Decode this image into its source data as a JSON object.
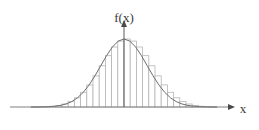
{
  "figure": {
    "title": "",
    "background_color": "#ffffff",
    "curve_color": "#6e6e6e",
    "bar_color": "#b4b4b4",
    "axis_color": "#808080",
    "label_color": "#3a3a3a"
  },
  "labels": {
    "y_axis": "f(x)",
    "x_axis": "x"
  },
  "icons": {
    "y_axis_arrow": "arrow-up-icon",
    "x_axis_arrow": "arrow-right-icon"
  },
  "chart_data": {
    "type": "bar",
    "title": "",
    "xlabel": "x",
    "ylabel": "f(x)",
    "grid": false,
    "legend": null,
    "xlim": [
      -4.0,
      4.0
    ],
    "ylim": [
      0.0,
      1.0
    ],
    "curve": {
      "name": "f(x)",
      "kind": "normal-density",
      "mean": 0.0,
      "std": 1.0,
      "x": [
        -4.0,
        -3.75,
        -3.5,
        -3.25,
        -3.0,
        -2.75,
        -2.5,
        -2.25,
        -2.0,
        -1.75,
        -1.5,
        -1.25,
        -1.0,
        -0.75,
        -0.5,
        -0.25,
        0.0,
        0.25,
        0.5,
        0.75,
        1.0,
        1.25,
        1.5,
        1.75,
        2.0,
        2.25,
        2.5,
        2.75,
        3.0,
        3.25,
        3.5,
        3.75,
        4.0
      ],
      "y": [
        0.0003,
        0.0009,
        0.0022,
        0.0051,
        0.0111,
        0.0228,
        0.0439,
        0.079,
        0.1353,
        0.2163,
        0.3247,
        0.4578,
        0.6065,
        0.7548,
        0.8825,
        0.9692,
        1.0,
        0.9692,
        0.8825,
        0.7548,
        0.6065,
        0.4578,
        0.3247,
        0.2163,
        0.1353,
        0.079,
        0.0439,
        0.0228,
        0.0111,
        0.0051,
        0.0022,
        0.0009,
        0.0003
      ]
    },
    "categories": [
      "-3.75",
      "-3.50",
      "-3.25",
      "-3.00",
      "-2.75",
      "-2.50",
      "-2.25",
      "-2.00",
      "-1.75",
      "-1.50",
      "-1.25",
      "-1.00",
      "-0.75",
      "-0.50",
      "-0.25",
      "0.00",
      "0.25",
      "0.50",
      "0.75",
      "1.00",
      "1.25",
      "1.50",
      "1.75",
      "2.00",
      "2.25",
      "2.50",
      "2.75",
      "3.00",
      "3.25",
      "3.50"
    ],
    "values": [
      0.0009,
      0.0022,
      0.0051,
      0.0111,
      0.0228,
      0.0439,
      0.079,
      0.1353,
      0.2163,
      0.3247,
      0.4578,
      0.6065,
      0.7548,
      0.8825,
      0.9692,
      1.0,
      0.9692,
      0.8825,
      0.7548,
      0.6065,
      0.4578,
      0.3247,
      0.2163,
      0.1353,
      0.079,
      0.0439,
      0.0228,
      0.0111,
      0.0051,
      0.0022
    ],
    "bar_count": 30,
    "bar_width": 0.25
  },
  "geometry": {
    "baseline_y": 107,
    "axis_x_start": 10,
    "axis_x_end": 228,
    "y_axis_x": 124,
    "y_axis_top": 27,
    "peak_y": 39,
    "bars_left": 31,
    "bars_right": 217
  }
}
